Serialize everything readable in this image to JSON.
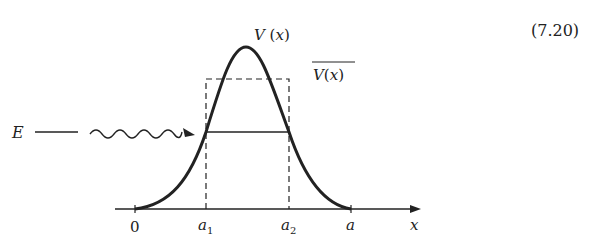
{
  "equation_number": "(7.20)",
  "labels": {
    "potential": "V(x)",
    "potential_avg": "V(x)",
    "energy": "E",
    "origin": "0",
    "a1": "a",
    "a1_sub": "1",
    "a2": "a",
    "a2_sub": "2",
    "a": "a",
    "x_axis": "x"
  },
  "colors": {
    "ink": "#222222",
    "background": "#ffffff"
  }
}
